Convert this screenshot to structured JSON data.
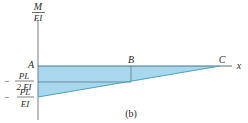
{
  "figure": {
    "caption": "(b)",
    "y_axis_label": {
      "numerator": "M",
      "denominator": "EI"
    },
    "x_axis_label": "x",
    "points": {
      "A": "A",
      "B": "B",
      "C": "C"
    },
    "y_ticks": [
      {
        "sign": "−",
        "numerator": "PL",
        "denominator": "2 EI"
      },
      {
        "sign": "−",
        "numerator": "PL",
        "denominator": "EI"
      }
    ]
  },
  "colors": {
    "fill": "#a9d8ee",
    "line": "#3aa8c8",
    "axis": "#7a7a7a",
    "top_edge": "#5a6e78"
  }
}
